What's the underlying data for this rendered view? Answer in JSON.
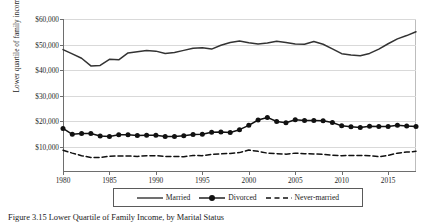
{
  "figure": {
    "caption": "Figure 3.15 Lower Quartile of Family Income, by Marital Status"
  },
  "legend": {
    "position": "bottom-center",
    "items": [
      {
        "label": "Married",
        "style": "solid-line",
        "icon": "solid-line-swatch-icon"
      },
      {
        "label": "Divorced",
        "style": "line-with-circle-markers",
        "icon": "marker-line-swatch-icon"
      },
      {
        "label": "Never-married",
        "style": "dashed-line",
        "icon": "dashed-line-swatch-icon"
      }
    ]
  },
  "chart_data": {
    "type": "line",
    "title": "",
    "xlabel": "",
    "ylabel": "Lower quartile of family income",
    "xlim": [
      1980,
      2018
    ],
    "ylim": [
      0,
      60000
    ],
    "grid": true,
    "ytick_labels": [
      "$60,000",
      "$50,000",
      "$40,000",
      "$30,000",
      "$20,000",
      "$10,000"
    ],
    "ytick_values": [
      60000,
      50000,
      40000,
      30000,
      20000,
      10000
    ],
    "xtick_labels": [
      "1980",
      "1985",
      "1990",
      "1995",
      "2000",
      "2005",
      "2010",
      "2015"
    ],
    "xtick_values": [
      1980,
      1985,
      1990,
      1995,
      2000,
      2005,
      2010,
      2015
    ],
    "x": [
      1980,
      1981,
      1982,
      1983,
      1984,
      1985,
      1986,
      1987,
      1988,
      1989,
      1990,
      1991,
      1992,
      1993,
      1994,
      1995,
      1996,
      1997,
      1998,
      1999,
      2000,
      2001,
      2002,
      2003,
      2004,
      2005,
      2006,
      2007,
      2008,
      2009,
      2010,
      2011,
      2012,
      2013,
      2014,
      2015,
      2016,
      2017,
      2018
    ],
    "series": [
      {
        "name": "Married",
        "color": "#333333",
        "marker": "none",
        "dash": "solid",
        "values": [
          48000,
          46300,
          44600,
          41600,
          41800,
          44200,
          44000,
          46700,
          47200,
          47600,
          47400,
          46500,
          46900,
          47700,
          48500,
          48700,
          48200,
          49700,
          50800,
          51400,
          50700,
          50200,
          50600,
          51300,
          50800,
          50200,
          50100,
          51200,
          50100,
          48300,
          46400,
          45900,
          45600,
          46500,
          48200,
          50300,
          52200,
          53500,
          55000
        ]
      },
      {
        "name": "Divorced",
        "color": "#111111",
        "marker": "circle",
        "dash": "solid",
        "values": [
          17100,
          14800,
          15100,
          15100,
          14100,
          13900,
          14600,
          14600,
          14300,
          14400,
          14400,
          13900,
          13900,
          14200,
          14700,
          14800,
          15600,
          15700,
          15500,
          16600,
          18300,
          20400,
          21400,
          19800,
          19300,
          20500,
          20200,
          20200,
          20100,
          19400,
          18100,
          17700,
          17500,
          17900,
          17800,
          17800,
          18300,
          18000,
          17800
        ]
      },
      {
        "name": "Never-married",
        "color": "#111111",
        "marker": "none",
        "dash": "dashed",
        "values": [
          8500,
          7400,
          6400,
          5700,
          5700,
          6200,
          6300,
          6300,
          6100,
          6400,
          6400,
          6100,
          6100,
          6000,
          6500,
          6400,
          6900,
          7100,
          7300,
          7600,
          8600,
          8100,
          7400,
          7200,
          7000,
          7400,
          7200,
          7100,
          6900,
          6600,
          6400,
          6500,
          6500,
          6400,
          6000,
          6500,
          7400,
          7800,
          8100
        ]
      }
    ]
  }
}
